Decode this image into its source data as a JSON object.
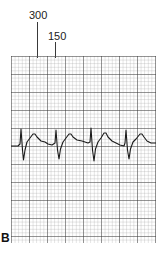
{
  "figure": {
    "label": "B",
    "markers": [
      {
        "text": "300",
        "x": 24
      },
      {
        "text": "150",
        "x": 42
      }
    ]
  },
  "strip": {
    "description": "ECG rhythm strip on grid paper",
    "beats": 4,
    "colors": {
      "trace": "#1a1a1a",
      "grid_major": "#3a3a3a",
      "grid_minor": "#9a9a9a",
      "background": "#ffffff"
    }
  }
}
